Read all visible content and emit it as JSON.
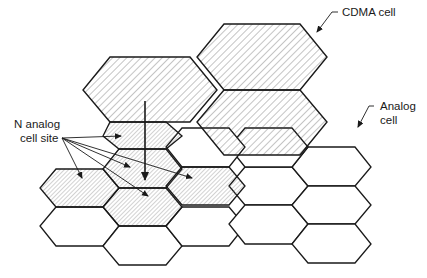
{
  "labels": {
    "cdma_cell": "CDMA cell",
    "analog_cell_line1": "Analog",
    "analog_cell_line2": "cell",
    "n_analog_line1": "N analog",
    "n_analog_line2": "cell site"
  },
  "colors": {
    "stroke": "#1a1a1a",
    "hatch_coarse": "#555555",
    "hatch_fine": "#666666",
    "background": "#ffffff"
  },
  "cells": {
    "cdma": [
      {
        "id": "cdma-upper",
        "points": "229,24 299,24 327,58 299,90 229,90 201,58"
      },
      {
        "id": "cdma-middle",
        "points": "167,58 229,58 257,90 229,124 167,124 139,90"
      },
      {
        "id": "cdma-right",
        "points": "229,90 299,90 327,124 299,158 229,158 201,124"
      }
    ],
    "analog_shaded": [
      {
        "id": "analog-shaded-top",
        "points": "112,110 158,110 168,120 158,131 112,131 103,120"
      },
      {
        "id": "analog-shaded-left",
        "points": "56,169 103,169 119,188 103,207 56,207 40,188"
      },
      {
        "id": "analog-shaded-center",
        "points": "119,150 166,150 182,169 166,188 119,188 103,169"
      },
      {
        "id": "analog-shaded-center-lower",
        "points": "119,188 166,188 182,207 166,226 119,226 103,207"
      },
      {
        "id": "analog-shaded-right",
        "points": "182,169 229,169 245,188 229,207 182,207 166,188"
      },
      {
        "id": "analog-shaded-mid",
        "points": "112,131 158,131 168,150 158,150 112,150 103,150"
      }
    ],
    "analog_plain": [
      {
        "id": "analog-1",
        "points": "56,207 103,207 119,226 103,246 56,246 40,226"
      },
      {
        "id": "analog-2",
        "points": "119,226 166,226 182,246 166,265 119,265 103,246"
      },
      {
        "id": "analog-3",
        "points": "182,207 229,207 245,226 229,246 182,246 166,226"
      },
      {
        "id": "analog-4",
        "points": "245,150 292,150 308,169 292,188 245,188 229,169"
      },
      {
        "id": "analog-5",
        "points": "245,188 292,188 308,207 292,226 245,226 229,207"
      },
      {
        "id": "analog-6",
        "points": "308,131 355,131 371,150 355,169 308,169 292,150"
      },
      {
        "id": "analog-7",
        "points": "308,169 355,169 371,188 355,207 308,207 292,188"
      },
      {
        "id": "analog-8",
        "points": "308,207 355,207 371,226 355,246 308,246 292,226"
      },
      {
        "id": "analog-9",
        "points": "245,131 292,131 308,150 292,169 245,169 229,150"
      },
      {
        "id": "analog-10",
        "points": "182,131 229,131 245,150 229,169 182,169 166,150"
      }
    ]
  },
  "arrows": {
    "n_origin": [
      62,
      138
    ],
    "n_targets": [
      [
        82,
        178
      ],
      [
        128,
        172
      ],
      [
        148,
        196
      ],
      [
        183,
        177
      ],
      [
        121,
        136
      ]
    ],
    "main_down": {
      "from": [
        145,
        101
      ],
      "to": [
        145,
        182
      ]
    }
  }
}
